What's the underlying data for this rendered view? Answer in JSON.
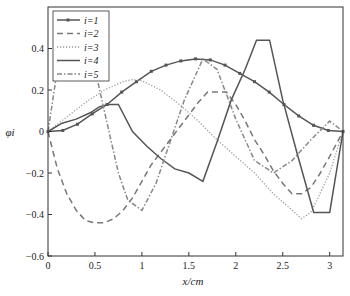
{
  "chart_data": {
    "type": "line",
    "title": "",
    "xlabel": "x/cm",
    "ylabel": "φi",
    "xlim": [
      0,
      3.1416
    ],
    "ylim": [
      -0.6,
      0.6
    ],
    "xticks": [
      0,
      0.5,
      1,
      1.5,
      2,
      2.5,
      3
    ],
    "xtick_labels": [
      "0",
      "0.5",
      "1",
      "1.5",
      "2",
      "2.5",
      "3"
    ],
    "yticks": [
      -0.6,
      -0.4,
      -0.2,
      0,
      0.2,
      0.4
    ],
    "ytick_labels": [
      "−0.6",
      "−0.4",
      "−0.2",
      "0",
      "0.2",
      "0.4"
    ],
    "grid": false,
    "legend_position": "upper left",
    "series": [
      {
        "name": "i=1",
        "style": "solid-marker",
        "color": "#555555",
        "x": [
          0,
          0.157,
          0.314,
          0.471,
          0.628,
          0.785,
          0.942,
          1.1,
          1.257,
          1.414,
          1.571,
          1.728,
          1.885,
          2.042,
          2.199,
          2.356,
          2.513,
          2.67,
          2.827,
          2.985,
          3.142
        ],
        "y": [
          0,
          0.005,
          0.035,
          0.085,
          0.13,
          0.19,
          0.24,
          0.29,
          0.32,
          0.34,
          0.35,
          0.345,
          0.32,
          0.28,
          0.24,
          0.19,
          0.13,
          0.075,
          0.03,
          0.005,
          0
        ]
      },
      {
        "name": "i=2",
        "style": "dashed",
        "color": "#777777",
        "x": [
          0,
          0.1,
          0.2,
          0.3,
          0.4,
          0.5,
          0.6,
          0.7,
          0.8,
          0.9,
          1.0,
          1.1,
          1.2,
          1.3,
          1.4,
          1.5,
          1.6,
          1.7,
          1.8,
          1.9,
          2.0,
          2.1,
          2.2,
          2.3,
          2.4,
          2.5,
          2.6,
          2.7,
          2.8,
          2.9,
          3.0,
          3.142
        ],
        "y": [
          0,
          -0.18,
          -0.3,
          -0.38,
          -0.43,
          -0.44,
          -0.44,
          -0.42,
          -0.38,
          -0.32,
          -0.24,
          -0.16,
          -0.1,
          -0.04,
          0.02,
          0.08,
          0.14,
          0.19,
          0.19,
          0.19,
          0.13,
          0.05,
          -0.04,
          -0.11,
          -0.19,
          -0.25,
          -0.3,
          -0.3,
          -0.27,
          -0.2,
          -0.12,
          0
        ]
      },
      {
        "name": "i=3",
        "style": "dotted",
        "color": "#999999",
        "x": [
          0,
          0.2,
          0.4,
          0.6,
          0.8,
          0.9,
          1.0,
          1.2,
          1.4,
          1.6,
          1.8,
          2.0,
          2.2,
          2.4,
          2.6,
          2.7,
          2.8,
          3.0,
          3.142
        ],
        "y": [
          0,
          0.07,
          0.14,
          0.2,
          0.24,
          0.25,
          0.245,
          0.2,
          0.13,
          0.05,
          -0.04,
          -0.12,
          -0.2,
          -0.3,
          -0.38,
          -0.42,
          -0.39,
          -0.2,
          0
        ]
      },
      {
        "name": "i=4",
        "style": "solid",
        "color": "#555555",
        "x": [
          0,
          0.15,
          0.3,
          0.45,
          0.55,
          0.65,
          0.75,
          0.9,
          1.05,
          1.2,
          1.35,
          1.5,
          1.65,
          1.8,
          1.95,
          2.1,
          2.22,
          2.36,
          2.5,
          2.65,
          2.83,
          3.0,
          3.142
        ],
        "y": [
          0,
          0.04,
          0.06,
          0.09,
          0.12,
          0.13,
          0.13,
          0.0,
          -0.07,
          -0.13,
          -0.18,
          -0.2,
          -0.24,
          -0.05,
          0.15,
          0.3,
          0.44,
          0.44,
          0.15,
          -0.1,
          -0.39,
          -0.39,
          0
        ]
      },
      {
        "name": "i=5",
        "style": "dashdot",
        "color": "#888888",
        "x": [
          0,
          0.1,
          0.2,
          0.3,
          0.4,
          0.5,
          0.6,
          0.75,
          0.85,
          1.0,
          1.15,
          1.3,
          1.45,
          1.65,
          1.8,
          2.0,
          2.2,
          2.4,
          2.6,
          2.8,
          3.0,
          3.142
        ],
        "y": [
          0,
          0.3,
          0.5,
          0.55,
          0.45,
          0.3,
          0.1,
          -0.2,
          -0.33,
          -0.38,
          -0.25,
          -0.05,
          0.15,
          0.35,
          0.3,
          0.06,
          -0.14,
          -0.2,
          -0.14,
          -0.04,
          0.05,
          0
        ]
      }
    ]
  },
  "legend": {
    "items": [
      "i=1",
      "i=2",
      "i=3",
      "i=4",
      "i=5"
    ]
  }
}
